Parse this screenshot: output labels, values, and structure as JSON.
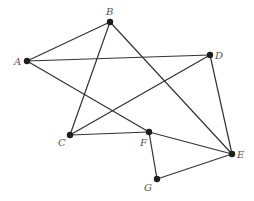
{
  "diagram": {
    "type": "undirected-graph",
    "colors": {
      "edge": "#333333",
      "node": "#1e1e1e",
      "label": "#555555",
      "background": "#ffffff"
    },
    "nodes": [
      {
        "id": "A",
        "label": "A",
        "x": 27,
        "y": 61,
        "lx": 14,
        "ly": 65
      },
      {
        "id": "B",
        "label": "B",
        "x": 110,
        "y": 22,
        "lx": 106,
        "ly": 15
      },
      {
        "id": "C",
        "label": "C",
        "x": 70,
        "y": 135,
        "lx": 58,
        "ly": 146
      },
      {
        "id": "D",
        "label": "D",
        "x": 210,
        "y": 55,
        "lx": 215,
        "ly": 59
      },
      {
        "id": "E",
        "label": "E",
        "x": 232,
        "y": 154,
        "lx": 237,
        "ly": 158
      },
      {
        "id": "F",
        "label": "F",
        "x": 149,
        "y": 132,
        "lx": 140,
        "ly": 146
      },
      {
        "id": "G",
        "label": "G",
        "x": 157,
        "y": 179,
        "lx": 144,
        "ly": 191
      }
    ],
    "edges": [
      {
        "from": "A",
        "to": "B"
      },
      {
        "from": "A",
        "to": "D"
      },
      {
        "from": "A",
        "to": "F"
      },
      {
        "from": "B",
        "to": "C"
      },
      {
        "from": "B",
        "to": "E"
      },
      {
        "from": "C",
        "to": "D"
      },
      {
        "from": "C",
        "to": "F"
      },
      {
        "from": "D",
        "to": "E"
      },
      {
        "from": "F",
        "to": "E"
      },
      {
        "from": "F",
        "to": "G"
      },
      {
        "from": "G",
        "to": "E"
      }
    ]
  }
}
